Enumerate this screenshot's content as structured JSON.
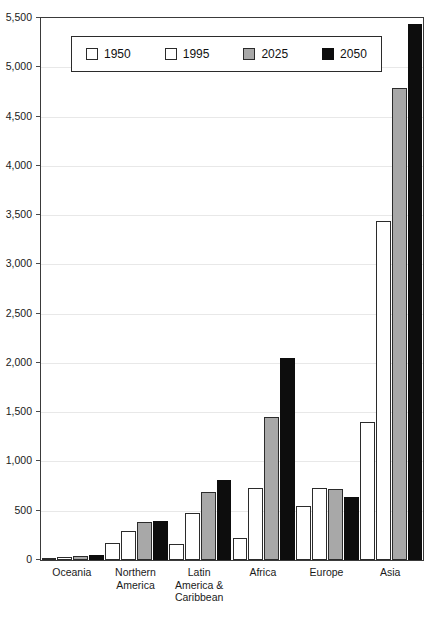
{
  "chart_data": {
    "type": "bar",
    "title": "",
    "xlabel": "",
    "ylabel": "",
    "ylim": [
      0,
      5500
    ],
    "ytick_step": 500,
    "grid": true,
    "legend_position": "top-left-inside",
    "categories": [
      "Oceania",
      "Northern\nAmerica",
      "Latin\nAmerica &\nCaribbean",
      "Africa",
      "Europe",
      "Asia"
    ],
    "ytick_labels": [
      "5,500",
      "5,000",
      "4,500",
      "4,000",
      "3,500",
      "3,000",
      "2,500",
      "2,000",
      "1,500",
      "1,000",
      "500",
      "0"
    ],
    "ytick_values": [
      5500,
      5000,
      4500,
      4000,
      3500,
      3000,
      2500,
      2000,
      1500,
      1000,
      500,
      0
    ],
    "series": [
      {
        "name": "1950",
        "fill": "#ffffff",
        "style": "s-white",
        "values": [
          13,
          172,
          167,
          224,
          548,
          1403
        ]
      },
      {
        "name": "1995",
        "fill": "#ffffff",
        "style": "s-white",
        "values": [
          28,
          297,
          477,
          728,
          727,
          3437
        ]
      },
      {
        "name": "2025",
        "fill": "#a8a8a8",
        "style": "s-gray",
        "values": [
          41,
          383,
          690,
          1454,
          718,
          4785
        ]
      },
      {
        "name": "2050",
        "fill": "#0d0d0d",
        "style": "s-black",
        "values": [
          46,
          392,
          810,
          2046,
          638,
          5443
        ]
      }
    ]
  },
  "legend": {
    "items": [
      {
        "label": "1950",
        "style": "s-white"
      },
      {
        "label": "1995",
        "style": "s-white"
      },
      {
        "label": "2025",
        "style": "s-gray"
      },
      {
        "label": "2050",
        "style": "s-black"
      }
    ]
  }
}
